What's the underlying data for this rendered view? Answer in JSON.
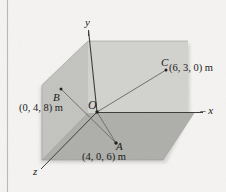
{
  "figure": {
    "background_color": "#f5f4f2",
    "plane_colors": {
      "back_vertical": "#cfcfcb",
      "left_vertical": "#bfbfbb",
      "ground_horizontal": "#aeaeaa"
    },
    "line_color": "#7a7a76",
    "text_color": "#1a1a1a"
  },
  "axes": [
    {
      "id": "y",
      "label": "y",
      "prefix": ""
    },
    {
      "id": "x",
      "label": "x",
      "prefix": "– "
    },
    {
      "id": "z",
      "label": "z",
      "prefix": ""
    }
  ],
  "origin": {
    "label": "O"
  },
  "points": [
    {
      "id": "A",
      "letter": "A",
      "coords": "(4, 0, 6) m",
      "x": 4,
      "y": 0,
      "z": 6
    },
    {
      "id": "B",
      "letter": "B",
      "coords": "(0, 4, 8) m",
      "x": 0,
      "y": 4,
      "z": 8
    },
    {
      "id": "C",
      "letter": "C",
      "coords": "(6, 3, 0) m",
      "x": 6,
      "y": 3,
      "z": 0
    }
  ]
}
